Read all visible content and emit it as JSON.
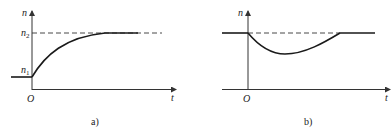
{
  "figure": {
    "panel_a": {
      "caption": "a)",
      "y_axis_label": "n",
      "x_axis_label": "t",
      "origin_label": "O",
      "level_high_label": "n",
      "level_high_sub": "2",
      "level_low_label": "n",
      "level_low_sub": "1",
      "description": "Speed rises exponentially from n1 at t=0 toward steady value n2"
    },
    "panel_b": {
      "caption": "b)",
      "y_axis_label": "n",
      "x_axis_label": "t",
      "origin_label": "O",
      "description": "Speed dips below steady value at t=0 then recovers back to the same level"
    },
    "colors": {
      "line": "#1a1a1a",
      "axis": "#333333",
      "dash": "#333333"
    }
  }
}
